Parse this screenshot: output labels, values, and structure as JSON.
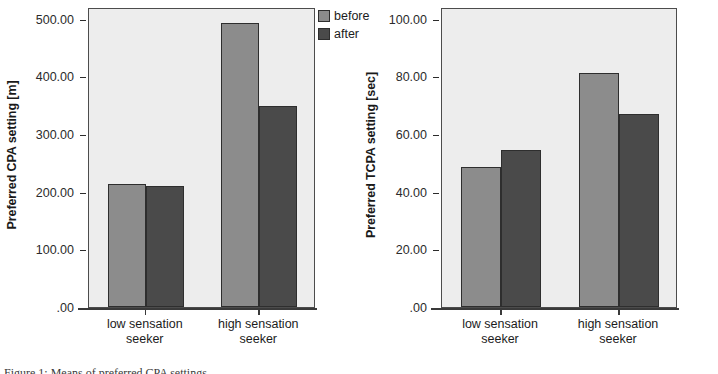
{
  "legend": {
    "items": [
      {
        "label": "before",
        "color": "#8c8c8c",
        "icon": "legend-swatch-icon"
      },
      {
        "label": "after",
        "color": "#4a4a4a",
        "icon": "legend-swatch-icon"
      }
    ]
  },
  "captions": {
    "left": "Figure 1: Means of preferred CPA settings",
    "right": "Figure 2: Means of preferred TCPA settings"
  },
  "chart_data": [
    {
      "type": "bar",
      "title": "",
      "xlabel": "",
      "ylabel": "Preferred CPA setting [m]",
      "categories": [
        "low sensation seeker",
        "high sensation seeker"
      ],
      "category_lines": [
        [
          "low sensation",
          "seeker"
        ],
        [
          "high sensation",
          "seeker"
        ]
      ],
      "series": [
        {
          "name": "before",
          "color": "#8c8c8c",
          "values": [
            214,
            493
          ]
        },
        {
          "name": "after",
          "color": "#4a4a4a",
          "values": [
            209,
            349
          ]
        }
      ],
      "ylim": [
        0,
        520
      ],
      "yticks": [
        0,
        100,
        200,
        300,
        400,
        500
      ],
      "ytick_labels": [
        ".00",
        "100.00",
        "200.00",
        "300.00",
        "400.00",
        "500.00"
      ],
      "grid": false,
      "legend_position": "top-right-outside"
    },
    {
      "type": "bar",
      "title": "",
      "xlabel": "",
      "ylabel": "Preferred TCPA setting [sec]",
      "categories": [
        "low sensation seeker",
        "high sensation seeker"
      ],
      "category_lines": [
        [
          "low sensation",
          "seeker"
        ],
        [
          "high sensation",
          "seeker"
        ]
      ],
      "series": [
        {
          "name": "before",
          "color": "#8c8c8c",
          "values": [
            48.5,
            81.0
          ]
        },
        {
          "name": "after",
          "color": "#4a4a4a",
          "values": [
            54.5,
            67.0
          ]
        }
      ],
      "ylim": [
        0,
        104
      ],
      "yticks": [
        0,
        20,
        40,
        60,
        80,
        100
      ],
      "ytick_labels": [
        ".00",
        "20.00",
        "40.00",
        "60.00",
        "80.00",
        "100.00"
      ],
      "grid": false,
      "legend_position": "top-left-outside"
    }
  ]
}
